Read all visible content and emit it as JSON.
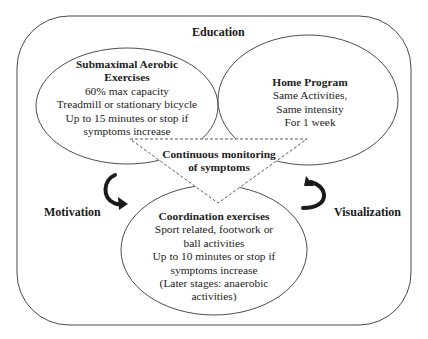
{
  "diagram": {
    "outer_frame": {
      "label": "Education"
    },
    "side_labels": {
      "left": "Motivation",
      "right": "Visualization"
    },
    "nodes": [
      {
        "id": "submaximal-aerobic",
        "title_lines": [
          "Submaximal Aerobic",
          "Exercises"
        ],
        "lines": [
          "60% max capacity",
          "Treadmill or stationary bicycle",
          "Up to 15 minutes or stop if",
          "symptoms increase"
        ]
      },
      {
        "id": "home-program",
        "title_lines": [
          "Home Program"
        ],
        "lines": [
          "Same Activities,",
          "Same intensity",
          "For 1 week"
        ]
      },
      {
        "id": "coordination-exercises",
        "title_lines": [
          "Coordination exercises"
        ],
        "lines": [
          "Sport related, footwork or",
          "ball activities",
          "Up to 10 minutes or stop if",
          "symptoms increase",
          "(Later stages: anaerobic",
          "activities)"
        ]
      }
    ],
    "center": {
      "title_lines": [
        "Continuous monitoring",
        "of symptoms"
      ]
    },
    "colors": {
      "stroke": "#3a3a3a",
      "arrow": "#1a1a1a",
      "background": "#ffffff"
    }
  }
}
